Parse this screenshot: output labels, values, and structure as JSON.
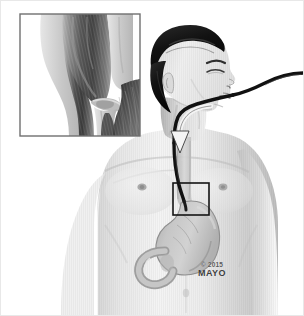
{
  "figure": {
    "alt": "Grayscale medical illustration of a man's head and torso in profile with an endoscope passed through the mouth down the esophagus into the stomach, with a magnified inset of the narrowed gastroesophageal junction",
    "width": 304,
    "height": 316,
    "background": "#ffffff",
    "border_color": "#e8e8e8"
  },
  "credit": {
    "year_line": "© 2015",
    "mark_line": "MAYO",
    "color": "#5a5a5a"
  },
  "inset": {
    "name": "gastroesophageal-junction-detail",
    "label": "Magnified view of narrowed gastroesophageal junction",
    "x": 18,
    "y": 12,
    "width": 122,
    "height": 124,
    "frame_color": "#707070",
    "fill": "#ffffff"
  },
  "callout_box": {
    "name": "callout-region",
    "label": "Area of detail at gastroesophageal junction",
    "x": 172,
    "y": 182,
    "width": 36,
    "height": 32,
    "stroke": "#141414"
  },
  "subject": {
    "name": "patient-figure",
    "label": "Patient head and torso, profile view",
    "skin_light": "#f2f2f2",
    "skin_mid": "#cfcfcf",
    "skin_shadow": "#a8a8a8",
    "hair_color": "#1a1a1a"
  },
  "endoscope": {
    "name": "endoscope-tube",
    "label": "Flexible endoscope inserted through the mouth",
    "color": "#111111",
    "width_px": 3.4
  },
  "arrow": {
    "name": "direction-arrow",
    "label": "Direction of endoscope advancement",
    "fill": "#f4f4f4",
    "stroke": "#3a3a3a"
  },
  "anatomy": {
    "stomach": {
      "name": "stomach",
      "label": "Stomach",
      "fill": "#c4c4c4",
      "stroke": "#8a8a8a"
    },
    "esophagus": {
      "name": "esophagus",
      "label": "Esophagus",
      "fill": "#cdcdcd",
      "stroke": "#8f8f8f"
    },
    "duodenum": {
      "name": "duodenum",
      "label": "Duodenum",
      "fill": "#c0c0c0",
      "stroke": "#8a8a8a"
    },
    "muscle_layer": {
      "name": "esophageal-muscle-layer",
      "label": "Esophageal muscle layer",
      "fill": "#4a4a4a"
    },
    "sphincter": {
      "name": "lower-esophageal-sphincter",
      "label": "Narrowed lower esophageal sphincter",
      "fill": "#bdbdbd"
    }
  }
}
